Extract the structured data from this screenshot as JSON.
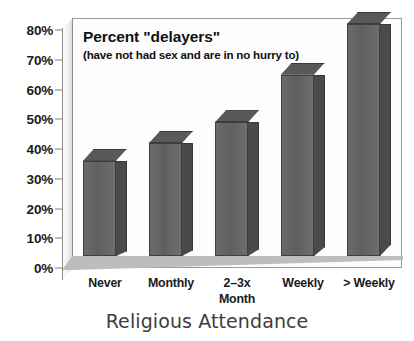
{
  "chart_data": {
    "type": "bar",
    "title": "Percent \"delayers\"",
    "subtitle": "(have not had sex and are in no hurry to)",
    "xlabel": "Religious Attendance",
    "ylabel": "",
    "categories": [
      "Never",
      "Monthly",
      "2–3x Month",
      "Weekly",
      "> Weekly"
    ],
    "category_lines": [
      [
        "Never"
      ],
      [
        "Monthly"
      ],
      [
        "2–3x",
        "Month"
      ],
      [
        "Weekly"
      ],
      [
        "> Weekly"
      ]
    ],
    "values": [
      32,
      38,
      45,
      61,
      78
    ],
    "ylim": [
      0,
      80
    ],
    "ytick_values": [
      0,
      10,
      20,
      30,
      40,
      50,
      60,
      70,
      80
    ],
    "ytick_labels": [
      "0%",
      "10%",
      "20%",
      "30%",
      "40%",
      "50%",
      "60%",
      "70%",
      "80%"
    ],
    "grid": false,
    "legend": "none",
    "style": "3d-column",
    "colors": {
      "bar_front": "#656565",
      "bar_side": "#4a4a4a",
      "bar_top": "#595959",
      "bar_outline": "#3a3a3a",
      "plot_background": "#fdfdfd",
      "floor": "#bdbdbd",
      "axis": "#8a8a8a",
      "text": "#111111",
      "xtitle_text": "#3d3d3d"
    }
  }
}
